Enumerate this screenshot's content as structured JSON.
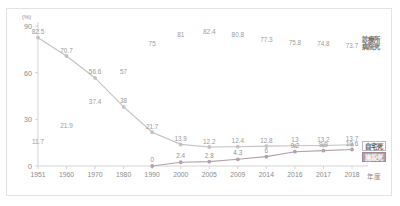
{
  "chart_data": {
    "type": "line",
    "title": "",
    "subtitle": "",
    "xlabel": "年度",
    "ylabel": "(%)",
    "unit": "(%)",
    "ylim": [
      0,
      90
    ],
    "yticks": [
      "0",
      "30",
      "60",
      "90"
    ],
    "grid": false,
    "legend_position": "right",
    "categories": [
      "1951",
      "1960",
      "1970",
      "1980",
      "1990",
      "2000",
      "2005",
      "2009",
      "2014",
      "2016",
      "2017",
      "2018"
    ],
    "series": [
      {
        "name": "診療所病院死",
        "color": "#b0b0b0",
        "has_line": false,
        "values": [
          11.7,
          21.9,
          37.4,
          57,
          75,
          81,
          82.4,
          80.8,
          77.3,
          75.8,
          74.8,
          73.7
        ],
        "labels": [
          "11.7",
          "21.9",
          "37.4",
          "57",
          "75",
          "81",
          "82.4",
          "80.8",
          "77.3",
          "75.8",
          "74.8",
          "73.7"
        ]
      },
      {
        "name": "自宅死",
        "color": "#c2c2c2",
        "has_line": true,
        "values": [
          82.5,
          70.7,
          56.6,
          38,
          21.7,
          13.9,
          12.2,
          12.4,
          12.8,
          13,
          13.2,
          13.7
        ],
        "labels": [
          "82.5",
          "70.7",
          "56.6",
          "38",
          "21.7",
          "13.9",
          "12.2",
          "12.4",
          "12.8",
          "13",
          "13.2",
          "13.7"
        ]
      },
      {
        "name": "施設死",
        "color": "#b3a0ab",
        "has_line": true,
        "values": [
          null,
          null,
          null,
          null,
          0,
          2.4,
          2.8,
          4.3,
          6,
          9.2,
          9.9,
          10.6
        ],
        "labels": [
          "",
          "",
          "",
          "",
          "0",
          "2.4",
          "2.8",
          "4.3",
          "6",
          "9.2",
          "9.9",
          "10.6"
        ]
      }
    ],
    "legend": [
      {
        "key": "hosp",
        "label_line1": "診療所",
        "label_line2": "病院死"
      },
      {
        "key": "home",
        "label": "自宅死"
      },
      {
        "key": "fac",
        "label": "施設死"
      }
    ]
  }
}
